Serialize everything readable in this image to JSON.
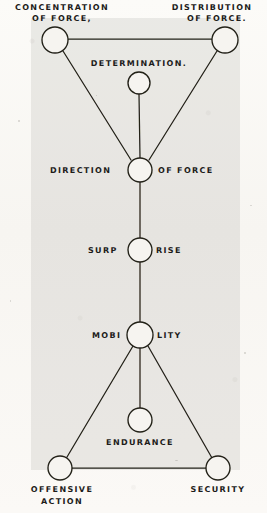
{
  "figure": {
    "title_top_left": "CONCENTRATION\nOF FORCE,",
    "nodes": [
      {
        "id": "concentration-of-force",
        "label_line1": "CONCENTRATION",
        "label_line2": "OF FORCE,",
        "cx": 55,
        "cy": 40,
        "r": 13
      },
      {
        "id": "distribution-of-force",
        "label_line1": "DISTRIBUTION",
        "label_line2": "OF FORCE.",
        "cx": 225,
        "cy": 40,
        "r": 13
      },
      {
        "id": "determination",
        "label": "DETERMINATION.",
        "cx": 139,
        "cy": 83,
        "r": 11
      },
      {
        "id": "direction-of-force",
        "label_left": "DIRECTION",
        "label_right": "OF FORCE",
        "cx": 140,
        "cy": 170,
        "r": 12
      },
      {
        "id": "surprise",
        "label_left": "SURP",
        "label_right": "RISE",
        "cx": 140,
        "cy": 250,
        "r": 12
      },
      {
        "id": "mobility",
        "label_left": "MOBI",
        "label_right": "LITY",
        "cx": 140,
        "cy": 335,
        "r": 13
      },
      {
        "id": "endurance",
        "label": "ENDURANCE",
        "cx": 140,
        "cy": 420,
        "r": 12
      },
      {
        "id": "offensive-action",
        "label_line1": "OFFENSIVE",
        "label_line2": "ACTION",
        "cx": 60,
        "cy": 468,
        "r": 12
      },
      {
        "id": "security",
        "label_line1": "SECURITY",
        "label_line2": "",
        "cx": 218,
        "cy": 468,
        "r": 12
      }
    ],
    "edges": [
      {
        "from": "concentration-of-force",
        "to": "distribution-of-force",
        "kind": "top-bar"
      },
      {
        "from": "concentration-of-force",
        "to": "direction-of-force",
        "kind": "diagonal"
      },
      {
        "from": "distribution-of-force",
        "to": "direction-of-force",
        "kind": "diagonal"
      },
      {
        "from": "determination",
        "to": "direction-of-force",
        "kind": "vertical"
      },
      {
        "from": "direction-of-force",
        "to": "surprise",
        "kind": "vertical"
      },
      {
        "from": "surprise",
        "to": "mobility",
        "kind": "vertical"
      },
      {
        "from": "mobility",
        "to": "endurance",
        "kind": "vertical"
      },
      {
        "from": "mobility",
        "to": "offensive-action",
        "kind": "diagonal"
      },
      {
        "from": "mobility",
        "to": "security",
        "kind": "diagonal"
      },
      {
        "from": "offensive-action",
        "to": "security",
        "kind": "bottom-bar"
      }
    ],
    "colors": {
      "ink": "#1d1c1a",
      "paper": "#fbfaf7",
      "plate_shade": "rgba(150,148,142,0.17)"
    }
  },
  "labels": {
    "concentration_l1": "CONCENTRATION",
    "concentration_l2": "OF FORCE,",
    "distribution_l1": "DISTRIBUTION",
    "distribution_l2": "OF FORCE.",
    "determination": "DETERMINATION.",
    "direction_left": "DIRECTION",
    "direction_right": "OF FORCE",
    "surprise_left": "SURP",
    "surprise_right": "RISE",
    "mobility_left": "MOBI",
    "mobility_right": "LITY",
    "endurance": "ENDURANCE",
    "offensive_l1": "OFFENSIVE",
    "offensive_l2": "ACTION",
    "security": "SECURITY"
  }
}
